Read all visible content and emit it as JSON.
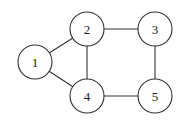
{
  "diagram": {
    "type": "undirected-graph",
    "nodes": [
      {
        "id": "1",
        "label": "1",
        "x": 35,
        "y": 62
      },
      {
        "id": "2",
        "label": "2",
        "x": 87,
        "y": 29
      },
      {
        "id": "3",
        "label": "3",
        "x": 155,
        "y": 29
      },
      {
        "id": "4",
        "label": "4",
        "x": 87,
        "y": 96
      },
      {
        "id": "5",
        "label": "5",
        "x": 155,
        "y": 96
      }
    ],
    "edges": [
      {
        "from": "1",
        "to": "2"
      },
      {
        "from": "1",
        "to": "4"
      },
      {
        "from": "2",
        "to": "3"
      },
      {
        "from": "2",
        "to": "4"
      },
      {
        "from": "3",
        "to": "5"
      },
      {
        "from": "4",
        "to": "5"
      }
    ],
    "node_radius": 17,
    "colors": {
      "stroke": "#333333",
      "fill": "#ffffff",
      "text": "#222222"
    }
  }
}
